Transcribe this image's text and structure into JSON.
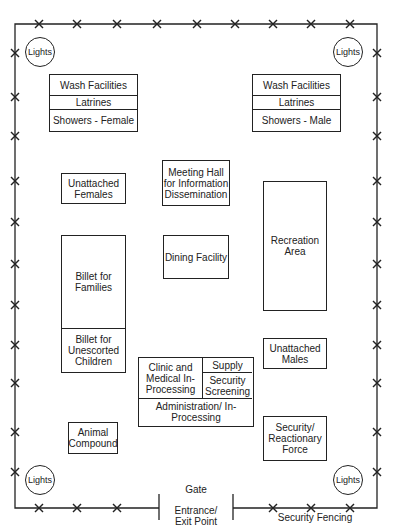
{
  "diagram": {
    "lights": [
      "Lights",
      "Lights",
      "Lights",
      "Lights"
    ],
    "wash_female": {
      "rows": [
        "Wash Facilities",
        "Latrines",
        "Showers - Female"
      ]
    },
    "wash_male": {
      "rows": [
        "Wash Facilities",
        "Latrines",
        "Showers - Male"
      ]
    },
    "meeting_hall": "Meeting Hall for Information Dissemination",
    "unattached_females": "Unattached Females",
    "dining": "Dining Facility",
    "recreation": "Recreation Area",
    "billet_families": "Billet for Families",
    "billet_children": "Billet for Unescorted Children",
    "unattached_males": "Unattached Males",
    "clinic": "Clinic and Medical In-Processing",
    "supply": "Supply",
    "security_screening": "Security Screening",
    "administration": "Administration/ In-Processing",
    "animal_compound": "Animal Compound",
    "security_force": "Security/ Reactionary Force",
    "gate": "Gate",
    "entrance": "Entrance/ Exit Point",
    "security_fencing": "Security Fencing"
  }
}
